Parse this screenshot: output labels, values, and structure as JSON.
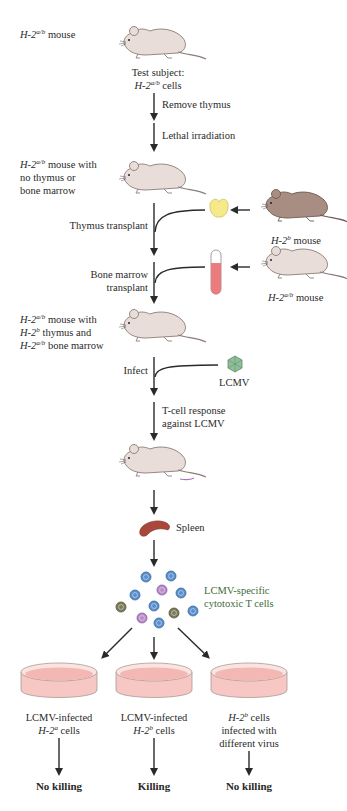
{
  "diagram": {
    "steps": {
      "start_mouse": {
        "prefix": "H-2",
        "sup": "a/b",
        "suffix": " mouse"
      },
      "test_subject": {
        "line1": "Test subject:",
        "prefix": "H-2",
        "sup": "a/b",
        "suffix": " cells"
      },
      "remove_thymus": "Remove thymus",
      "lethal_irradiation": "Lethal irradiation",
      "mouse_no_thymus": {
        "prefix": "H-2",
        "sup": "a/b",
        "line1_suffix": " mouse with",
        "line2": "no thymus or",
        "line3": "bone marrow"
      },
      "thymus_transplant": "Thymus transplant",
      "donor_thymus_mouse": {
        "prefix": "H-2",
        "sup": "b",
        "suffix": " mouse"
      },
      "bone_marrow_transplant": {
        "line1": "Bone marrow",
        "line2": "transplant"
      },
      "donor_marrow_mouse": {
        "prefix": "H-2",
        "sup": "a/b",
        "suffix": " mouse"
      },
      "reconstituted_mouse": {
        "l1_prefix": "H-2",
        "l1_sup": "a/b",
        "l1_suffix": " mouse with",
        "l2_prefix": "H-2",
        "l2_sup": "b",
        "l2_suffix": " thymus and",
        "l3_prefix": "H-2",
        "l3_sup": "a/b",
        "l3_suffix": " bone marrow"
      },
      "infect": "Infect",
      "virus": "LCMV",
      "t_cell_response": {
        "line1": "T-cell response",
        "line2": "against LCMV"
      },
      "spleen": "Spleen",
      "t_cells": {
        "line1": "LCMV-specific",
        "line2": "cytotoxic T cells"
      }
    },
    "dishes": [
      {
        "line1": "LCMV-infected",
        "prefix": "H-2",
        "sup": "a",
        "suffix": " cells",
        "result": "No killing"
      },
      {
        "line1": "LCMV-infected",
        "prefix": "H-2",
        "sup": "b",
        "suffix": " cells",
        "result": "Killing"
      },
      {
        "prefix": "H-2",
        "sup": "b",
        "suffix": " cells",
        "line2": "infected with",
        "line3": "different virus",
        "result": "No killing"
      }
    ],
    "colors": {
      "mouse_light": "#e8ddd8",
      "mouse_dark": "#a88e82",
      "thymus": "#f5e98a",
      "marrow": "#ec7b7d",
      "virus": "#8fbf98",
      "spleen": "#a8473a",
      "dish": "#f4b8b4",
      "t_cell_blue": "#5a8fcc",
      "t_cell_purple": "#b88ac8",
      "t_cell_olive": "#7a7a5a",
      "label_green": "#3f6a3a"
    }
  }
}
